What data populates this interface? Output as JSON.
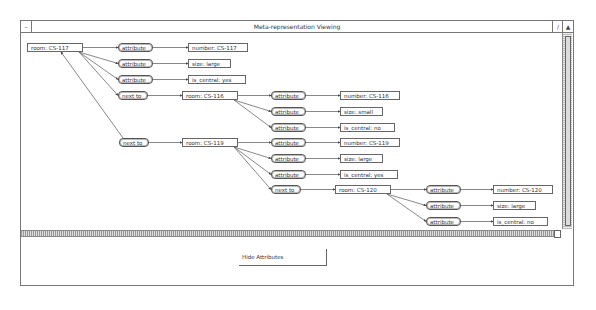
{
  "window": {
    "title": "Meta-representation Viewing",
    "left_button": "–",
    "right_buttons": [
      "/",
      "▲"
    ]
  },
  "graph": {
    "nodes": [
      {
        "id": "n1",
        "type": "entity",
        "label": "room: CS-117",
        "x": 6,
        "y": 10,
        "w": 56
      },
      {
        "id": "n2",
        "type": "relation",
        "label": "attribute",
        "x": 97,
        "y": 10,
        "w": 35
      },
      {
        "id": "n3",
        "type": "entity",
        "label": "number: CS-117",
        "x": 167,
        "y": 10,
        "w": 60
      },
      {
        "id": "n4",
        "type": "relation",
        "label": "attribute",
        "x": 97,
        "y": 26,
        "w": 35
      },
      {
        "id": "n5",
        "type": "entity",
        "label": "size: large",
        "x": 167,
        "y": 26,
        "w": 43
      },
      {
        "id": "n6",
        "type": "relation",
        "label": "attribute",
        "x": 97,
        "y": 42,
        "w": 35
      },
      {
        "id": "n7",
        "type": "entity",
        "label": "is_central: yes",
        "x": 167,
        "y": 42,
        "w": 58
      },
      {
        "id": "n8",
        "type": "relation",
        "label": "next to",
        "x": 97,
        "y": 58,
        "w": 30
      },
      {
        "id": "n9",
        "type": "entity",
        "label": "room: CS-116",
        "x": 161,
        "y": 58,
        "w": 56
      },
      {
        "id": "n10",
        "type": "relation",
        "label": "attribute",
        "x": 250,
        "y": 58,
        "w": 35
      },
      {
        "id": "n11",
        "type": "entity",
        "label": "number: CS-116",
        "x": 319,
        "y": 58,
        "w": 60
      },
      {
        "id": "n12",
        "type": "relation",
        "label": "attribute",
        "x": 250,
        "y": 74,
        "w": 35
      },
      {
        "id": "n13",
        "type": "entity",
        "label": "size: small",
        "x": 319,
        "y": 74,
        "w": 43
      },
      {
        "id": "n14",
        "type": "relation",
        "label": "attribute",
        "x": 250,
        "y": 90,
        "w": 35
      },
      {
        "id": "n15",
        "type": "entity",
        "label": "is_central: no",
        "x": 319,
        "y": 90,
        "w": 55
      },
      {
        "id": "n16",
        "type": "relation",
        "label": "next to",
        "x": 98,
        "y": 105,
        "w": 30
      },
      {
        "id": "n17",
        "type": "entity",
        "label": "room: CS-119",
        "x": 161,
        "y": 105,
        "w": 56
      },
      {
        "id": "n18",
        "type": "relation",
        "label": "attribute",
        "x": 250,
        "y": 105,
        "w": 35
      },
      {
        "id": "n19",
        "type": "entity",
        "label": "number: CS-119",
        "x": 319,
        "y": 105,
        "w": 60
      },
      {
        "id": "n20",
        "type": "relation",
        "label": "attribute",
        "x": 250,
        "y": 121,
        "w": 35
      },
      {
        "id": "n21",
        "type": "entity",
        "label": "size: large",
        "x": 319,
        "y": 121,
        "w": 43
      },
      {
        "id": "n22",
        "type": "relation",
        "label": "attribute",
        "x": 250,
        "y": 137,
        "w": 35
      },
      {
        "id": "n23",
        "type": "entity",
        "label": "is_central: yes",
        "x": 319,
        "y": 137,
        "w": 58
      },
      {
        "id": "n24",
        "type": "relation",
        "label": "next to",
        "x": 250,
        "y": 152,
        "w": 30
      },
      {
        "id": "n25",
        "type": "entity",
        "label": "room: CS-120",
        "x": 314,
        "y": 152,
        "w": 56
      },
      {
        "id": "n26",
        "type": "relation",
        "label": "attribute",
        "x": 405,
        "y": 152,
        "w": 35
      },
      {
        "id": "n27",
        "type": "entity",
        "label": "number: CS-120",
        "x": 472,
        "y": 152,
        "w": 60
      },
      {
        "id": "n28",
        "type": "relation",
        "label": "attribute",
        "x": 405,
        "y": 168,
        "w": 35
      },
      {
        "id": "n29",
        "type": "entity",
        "label": "size: large",
        "x": 472,
        "y": 168,
        "w": 43
      },
      {
        "id": "n30",
        "type": "relation",
        "label": "attribute",
        "x": 405,
        "y": 184,
        "w": 35
      },
      {
        "id": "n31",
        "type": "entity",
        "label": "is_central: no",
        "x": 472,
        "y": 184,
        "w": 55
      }
    ],
    "edges": [
      [
        "n1",
        "n2"
      ],
      [
        "n2",
        "n3"
      ],
      [
        "n1",
        "n4"
      ],
      [
        "n4",
        "n5"
      ],
      [
        "n1",
        "n6"
      ],
      [
        "n6",
        "n7"
      ],
      [
        "n1",
        "n8"
      ],
      [
        "n8",
        "n9"
      ],
      [
        "n9",
        "n10"
      ],
      [
        "n10",
        "n11"
      ],
      [
        "n9",
        "n12"
      ],
      [
        "n12",
        "n13"
      ],
      [
        "n9",
        "n14"
      ],
      [
        "n14",
        "n15"
      ],
      [
        "n16",
        "n1"
      ],
      [
        "n16",
        "n17"
      ],
      [
        "n17",
        "n18"
      ],
      [
        "n18",
        "n19"
      ],
      [
        "n17",
        "n20"
      ],
      [
        "n20",
        "n21"
      ],
      [
        "n17",
        "n22"
      ],
      [
        "n22",
        "n23"
      ],
      [
        "n17",
        "n24"
      ],
      [
        "n24",
        "n25"
      ],
      [
        "n25",
        "n26"
      ],
      [
        "n26",
        "n27"
      ],
      [
        "n25",
        "n28"
      ],
      [
        "n28",
        "n29"
      ],
      [
        "n25",
        "n30"
      ],
      [
        "n30",
        "n31"
      ]
    ]
  },
  "controls": {
    "hide_attributes_label": "Hide Attributes"
  }
}
